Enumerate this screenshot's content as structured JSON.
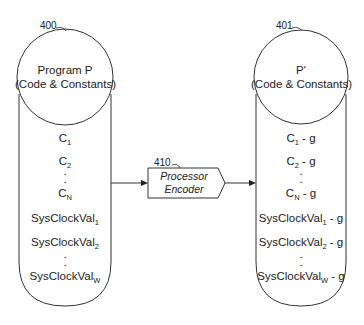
{
  "left_store": {
    "ref": "400",
    "title": "Program P",
    "subtitle": "(Code & Constants)",
    "items": [
      {
        "base": "C",
        "sub": "1",
        "suffix": ""
      },
      {
        "base": "C",
        "sub": "2",
        "suffix": ""
      },
      {
        "base": "C",
        "sub": "N",
        "suffix": ""
      },
      {
        "base": "SysClockVal",
        "sub": "1",
        "suffix": ""
      },
      {
        "base": "SysClockVal",
        "sub": "2",
        "suffix": ""
      },
      {
        "base": "SysClockVal",
        "sub": "W",
        "suffix": ""
      }
    ],
    "ellipsis": "."
  },
  "encoder": {
    "ref": "410",
    "line1": "Processor",
    "line2": "Encoder"
  },
  "right_store": {
    "ref": "401",
    "title": "P'",
    "subtitle": "(Code & Constants)",
    "items": [
      {
        "base": "C",
        "sub": "1",
        "suffix": " - g"
      },
      {
        "base": "C",
        "sub": "2",
        "suffix": " - g"
      },
      {
        "base": "C",
        "sub": "N",
        "suffix": " - g"
      },
      {
        "base": "SysClockVal",
        "sub": "1",
        "suffix": " - g"
      },
      {
        "base": "SysClockVal",
        "sub": "2",
        "suffix": " - g"
      },
      {
        "base": "SysClockVal",
        "sub": "W",
        "suffix": " - g"
      }
    ],
    "ellipsis": "."
  },
  "colors": {
    "stroke": "#333333",
    "text": "#222222",
    "background": "#ffffff"
  }
}
